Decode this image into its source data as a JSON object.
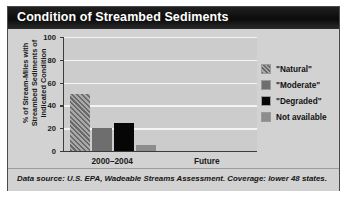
{
  "header": {
    "title": "Condition of Streambed Sediments"
  },
  "footnote": {
    "text": "Data source: U.S. EPA, Wadeable Streams Assessment. Coverage: lower 48 states."
  },
  "legend": {
    "items": [
      {
        "label": "\"Natural\"",
        "swatch": "natural",
        "color": "#777777"
      },
      {
        "label": "\"Moderate\"",
        "swatch": "moderate",
        "color": "#6e6e6e"
      },
      {
        "label": "\"Degraded\"",
        "swatch": "degraded",
        "color": "#060606"
      },
      {
        "label": "Not available",
        "swatch": "notavail",
        "color": "#8d8d8d"
      }
    ]
  },
  "chart_data": {
    "type": "bar",
    "title": "Condition of Streambed Sediments",
    "xlabel": "",
    "ylabel": "% of Stream-Miles with Streambed Sediments of Indicated Condition",
    "categories": [
      "2000–2004",
      "Future"
    ],
    "series": [
      {
        "name": "\"Natural\"",
        "values": [
          50,
          null
        ]
      },
      {
        "name": "\"Moderate\"",
        "values": [
          20,
          null
        ]
      },
      {
        "name": "\"Degraded\"",
        "values": [
          25,
          null
        ]
      },
      {
        "name": "Not available",
        "values": [
          5,
          null
        ]
      }
    ],
    "ylim": [
      0,
      100
    ],
    "yticks": [
      0,
      20,
      40,
      60,
      80,
      100
    ],
    "ytick_labels": [
      "0",
      "20",
      "40",
      "60",
      "80",
      "100"
    ],
    "grid": "horizontal",
    "legend_position": "right",
    "plot_background": "#cccccc",
    "gridline_color": "#f4f4f4"
  }
}
